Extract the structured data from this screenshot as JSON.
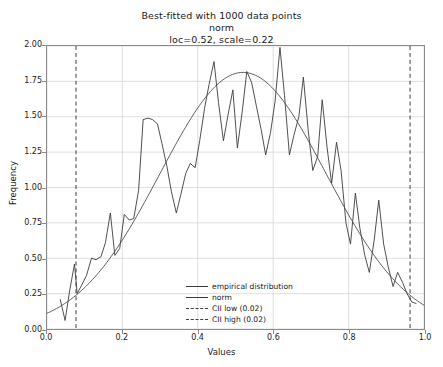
{
  "chart_data": {
    "type": "line",
    "title": "Best-fitted with 1000 data points",
    "subtitle": "norm",
    "params": "loc=0.52, scale=0.22",
    "xlabel": "Values",
    "ylabel": "Frequency",
    "xlim": [
      0.0,
      1.0
    ],
    "ylim": [
      0.0,
      2.0
    ],
    "xticks": [
      "0.0",
      "0.2",
      "0.4",
      "0.6",
      "0.8",
      "1.0"
    ],
    "xtick_values": [
      0.0,
      0.2,
      0.4,
      0.6,
      0.8,
      1.0
    ],
    "yticks": [
      "0.00",
      "0.25",
      "0.50",
      "0.75",
      "1.00",
      "1.25",
      "1.50",
      "1.75",
      "2.00"
    ],
    "ytick_values": [
      0.0,
      0.25,
      0.5,
      0.75,
      1.0,
      1.25,
      1.5,
      1.75,
      2.0
    ],
    "grid": true,
    "legend_position": "lower center",
    "series": [
      {
        "name": "empirical distribution",
        "style": "solid",
        "color": "#3a3a3a",
        "x": [
          0.035,
          0.048,
          0.06,
          0.073,
          0.08,
          0.092,
          0.105,
          0.118,
          0.13,
          0.143,
          0.155,
          0.168,
          0.18,
          0.193,
          0.205,
          0.218,
          0.23,
          0.243,
          0.255,
          0.268,
          0.28,
          0.293,
          0.305,
          0.318,
          0.33,
          0.343,
          0.355,
          0.368,
          0.38,
          0.393,
          0.405,
          0.418,
          0.43,
          0.443,
          0.455,
          0.468,
          0.48,
          0.493,
          0.505,
          0.518,
          0.53,
          0.543,
          0.555,
          0.568,
          0.58,
          0.593,
          0.605,
          0.618,
          0.63,
          0.643,
          0.655,
          0.668,
          0.68,
          0.693,
          0.705,
          0.718,
          0.73,
          0.743,
          0.755,
          0.768,
          0.78,
          0.793,
          0.805,
          0.818,
          0.83,
          0.843,
          0.855,
          0.868,
          0.88,
          0.893,
          0.905,
          0.918,
          0.93,
          0.943,
          0.955,
          0.968,
          0.98
        ],
        "y": [
          0.21,
          0.06,
          0.27,
          0.46,
          0.25,
          0.31,
          0.38,
          0.5,
          0.49,
          0.51,
          0.61,
          0.82,
          0.52,
          0.57,
          0.81,
          0.77,
          0.78,
          0.98,
          1.48,
          1.49,
          1.48,
          1.45,
          1.31,
          1.15,
          0.97,
          0.82,
          0.95,
          1.1,
          1.17,
          1.14,
          1.33,
          1.56,
          1.73,
          1.89,
          1.6,
          1.33,
          1.51,
          1.69,
          1.28,
          1.54,
          1.82,
          1.74,
          1.58,
          1.41,
          1.23,
          1.39,
          1.61,
          1.99,
          1.65,
          1.23,
          1.37,
          1.5,
          1.78,
          1.4,
          1.12,
          1.22,
          1.62,
          1.28,
          1.03,
          1.32,
          1.12,
          0.75,
          0.6,
          0.96,
          0.71,
          0.52,
          0.4,
          0.63,
          0.91,
          0.6,
          0.44,
          0.3,
          0.4,
          0.33,
          0.25,
          0.19,
          0.18
        ]
      },
      {
        "name": "norm",
        "style": "solid",
        "color": "#4a4a4a",
        "loc": 0.52,
        "scale": 0.22,
        "peak": 1.825
      }
    ],
    "vlines": [
      {
        "name": "CII low (0.02)",
        "value": 0.077,
        "style": "dashed",
        "color": "#3a3a3a"
      },
      {
        "name": "CII high (0.02)",
        "value": 0.963,
        "style": "dashed",
        "color": "#3a3a3a"
      }
    ],
    "legend": [
      {
        "label": "empirical distribution",
        "style": "solid"
      },
      {
        "label": "norm",
        "style": "solid"
      },
      {
        "label": "CII low (0.02)",
        "style": "dashed"
      },
      {
        "label": "CII high (0.02)",
        "style": "dashed"
      }
    ]
  }
}
